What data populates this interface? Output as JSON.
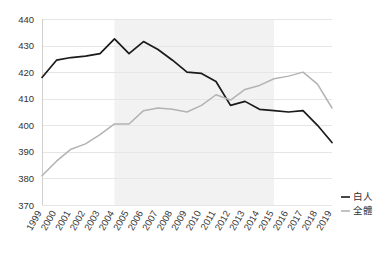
{
  "chart_data": {
    "type": "line",
    "title": "",
    "subtitle": "",
    "xlabel": "",
    "ylabel": "",
    "ylim": [
      370,
      440
    ],
    "yticks": [
      370,
      380,
      390,
      400,
      410,
      420,
      430,
      440
    ],
    "grid": true,
    "legend_position": "right",
    "categories": [
      "1999",
      "2000",
      "2001",
      "2002",
      "2003",
      "2004",
      "2005",
      "2006",
      "2007",
      "2008",
      "2009",
      "2010",
      "2011",
      "2012",
      "2013",
      "2014",
      "2015",
      "2016",
      "2017",
      "2018",
      "2019"
    ],
    "series": [
      {
        "name": "白人",
        "color": "#1a1a1a",
        "values": [
          418.0,
          424.5,
          425.5,
          426.0,
          427.0,
          432.5,
          427.0,
          431.5,
          428.5,
          424.5,
          420.0,
          419.5,
          416.5,
          407.5,
          409.0,
          406.0,
          405.5,
          405.0,
          405.5,
          400.0,
          393.5
        ]
      },
      {
        "name": "全體",
        "color": "#b3b3b3",
        "values": [
          381.0,
          386.5,
          391.0,
          393.0,
          396.5,
          400.5,
          400.5,
          405.5,
          406.5,
          406.0,
          405.0,
          407.5,
          411.5,
          409.5,
          413.5,
          415.0,
          417.5,
          418.5,
          420.0,
          415.5,
          406.5
        ]
      }
    ],
    "shaded_band": {
      "from": "2004",
      "to": "2015",
      "color": "#f2f2f2"
    }
  },
  "legend": {
    "items": [
      {
        "label": "白人",
        "color": "#1a1a1a"
      },
      {
        "label": "全體",
        "color": "#b3b3b3"
      }
    ]
  }
}
